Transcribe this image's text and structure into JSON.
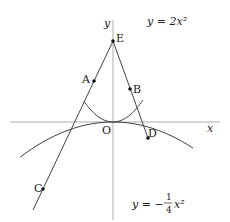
{
  "axes": {
    "x_label": "x",
    "y_label": "y",
    "origin_label": "O"
  },
  "curves": [
    {
      "name": "upper-parabola",
      "label": "y = 2x²",
      "a": 2
    },
    {
      "name": "lower-parabola",
      "label_prefix": "y = −",
      "label_num": "1",
      "label_den": "4",
      "label_suffix": "x²",
      "a": -0.25
    }
  ],
  "points": [
    {
      "label": "A"
    },
    {
      "label": "B"
    },
    {
      "label": "C"
    },
    {
      "label": "D"
    },
    {
      "label": "E"
    }
  ],
  "colors": {
    "stroke": "#444444",
    "axis": "#999999"
  }
}
